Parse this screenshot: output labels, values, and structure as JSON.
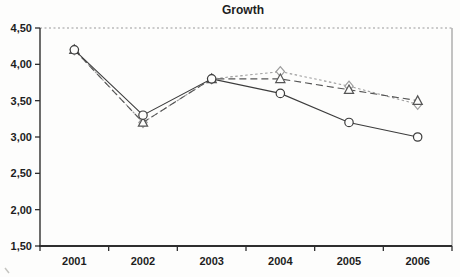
{
  "chart_data": {
    "type": "line",
    "title": "Growth",
    "categories": [
      "2001",
      "2002",
      "2003",
      "2004",
      "2005",
      "2006"
    ],
    "series": [
      {
        "name": "circle-series",
        "marker": "circle",
        "line_style": "solid",
        "color": "#3c3c3c",
        "values": [
          4.2,
          3.3,
          3.8,
          3.6,
          3.2,
          3.0
        ]
      },
      {
        "name": "triangle-series",
        "marker": "triangle",
        "line_style": "dashed",
        "color": "#555555",
        "values": [
          4.2,
          3.2,
          3.8,
          3.8,
          3.65,
          3.5
        ]
      },
      {
        "name": "diamond-series",
        "marker": "diamond",
        "line_style": "dotted",
        "color": "#9d9d9d",
        "values": [
          4.2,
          3.2,
          3.8,
          3.9,
          3.7,
          3.45
        ]
      }
    ],
    "xlabel": "",
    "ylabel": "",
    "ylim": [
      1.5,
      4.5
    ],
    "y_ticks": [
      4.5,
      4.0,
      3.5,
      3.0,
      2.5,
      2.0,
      1.5
    ],
    "y_tick_labels": [
      "4,50",
      "4,00",
      "3,50",
      "3,00",
      "2,50",
      "2,00",
      "1,50"
    ],
    "grid": "top-gridline-only",
    "legend": "none",
    "colors": {
      "axis": "#2e2e2e",
      "gridline": "#9a9a9a",
      "right_border": "#aeaeae",
      "marker_fill": "#fdfdfc",
      "background": "#fdfdfc"
    }
  }
}
